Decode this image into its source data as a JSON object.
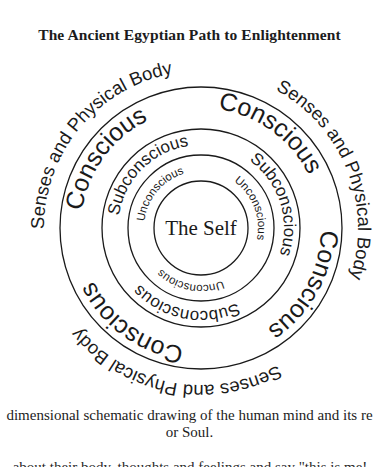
{
  "title": "The Ancient Egyptian Path to Enlightenment",
  "diagram": {
    "center_label": "The Self",
    "rings": {
      "outer": {
        "label": "Senses and Physical Body",
        "copies": 3
      },
      "conscious": {
        "label": "Conscious",
        "copies": 4
      },
      "subconscious": {
        "label": "Subconscious",
        "copies": 3
      },
      "unconscious": {
        "label": "Unconscious",
        "copies": 3
      }
    }
  },
  "caption": {
    "line1": "dimensional schematic drawing of the human mind and its re",
    "line2": "or Soul.",
    "line3_partial": "about their body, thoughts and feelings and say \"this is me!"
  }
}
